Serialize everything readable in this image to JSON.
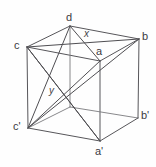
{
  "figure": {
    "name": "labeled-cube-diagram",
    "type": "geometry-diagram",
    "background_color": "#fefefe",
    "edge_color": "#57565a",
    "diagonal_color": "#4f4e52",
    "label_color": "#3b3a3e"
  },
  "vertices": [
    {
      "id": "d",
      "label": "d",
      "x": 70,
      "y": 26,
      "label_x": 66,
      "label_y": 12
    },
    {
      "id": "c",
      "label": "c",
      "x": 27,
      "y": 47,
      "label_x": 14,
      "label_y": 40
    },
    {
      "id": "b",
      "label": "b",
      "x": 139,
      "y": 39,
      "label_x": 142,
      "label_y": 31
    },
    {
      "id": "a",
      "label": "a",
      "x": 100,
      "y": 61,
      "label_x": 96,
      "label_y": 46
    },
    {
      "id": "c2",
      "label": "c'",
      "x": 28,
      "y": 128,
      "label_x": 13,
      "label_y": 121
    },
    {
      "id": "b2",
      "label": "b'",
      "x": 138,
      "y": 118,
      "label_x": 141,
      "label_y": 110
    },
    {
      "id": "a2",
      "label": "a'",
      "x": 100,
      "y": 141,
      "label_x": 95,
      "label_y": 146
    },
    {
      "id": "d2",
      "label": "",
      "x": 70,
      "y": 107,
      "label_x": 0,
      "label_y": 0
    }
  ],
  "marked_points": [
    {
      "id": "x",
      "label": "x",
      "x": 88,
      "y": 40,
      "label_x": 84,
      "label_y": 29
    },
    {
      "id": "y",
      "label": "y",
      "x": 61,
      "y": 96,
      "label_x": 49,
      "label_y": 86
    }
  ],
  "edges": [
    {
      "from": "d",
      "to": "c",
      "kind": "top-face"
    },
    {
      "from": "d",
      "to": "b",
      "kind": "top-face"
    },
    {
      "from": "c",
      "to": "a",
      "kind": "top-face"
    },
    {
      "from": "a",
      "to": "b",
      "kind": "top-face"
    },
    {
      "from": "c",
      "to": "c2",
      "kind": "vertical"
    },
    {
      "from": "b",
      "to": "b2",
      "kind": "vertical"
    },
    {
      "from": "a",
      "to": "a2",
      "kind": "vertical"
    },
    {
      "from": "d",
      "to": "d2",
      "kind": "vertical-hidden"
    },
    {
      "from": "c2",
      "to": "d2",
      "kind": "bottom-face-hidden"
    },
    {
      "from": "d2",
      "to": "b2",
      "kind": "bottom-face-hidden"
    },
    {
      "from": "c2",
      "to": "a2",
      "kind": "bottom-face"
    },
    {
      "from": "a2",
      "to": "b2",
      "kind": "bottom-face"
    }
  ],
  "diagonals": [
    {
      "from": "d",
      "to": "a",
      "kind": "top-face-diagonal"
    },
    {
      "from": "c",
      "to": "b",
      "kind": "top-face-diagonal"
    },
    {
      "from": "c",
      "to": "a2",
      "kind": "body-diagonal"
    },
    {
      "from": "d",
      "to": "c2",
      "kind": "face-diagonal"
    },
    {
      "from": "c2",
      "to": "a",
      "kind": "face-diagonal"
    },
    {
      "from": "a2",
      "to": "c",
      "kind": "body-diagonal-repeat"
    },
    {
      "from": "c2",
      "to": "b",
      "kind": "long-diagonal"
    }
  ]
}
